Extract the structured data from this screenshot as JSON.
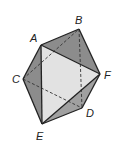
{
  "diagram": {
    "type": "octahedron",
    "vertices": {
      "A": {
        "label": "A",
        "x": 41,
        "y": 45,
        "lx": 30,
        "ly": 42
      },
      "B": {
        "label": "B",
        "x": 79,
        "y": 29,
        "lx": 75,
        "ly": 24
      },
      "C": {
        "label": "C",
        "x": 23,
        "y": 79,
        "lx": 12,
        "ly": 83
      },
      "D": {
        "label": "D",
        "x": 82,
        "y": 108,
        "lx": 86,
        "ly": 117
      },
      "E": {
        "label": "E",
        "x": 42,
        "y": 124,
        "lx": 36,
        "ly": 140
      },
      "F": {
        "label": "F",
        "x": 100,
        "y": 74,
        "lx": 104,
        "ly": 79
      }
    },
    "visible_edges": [
      "AB",
      "BF",
      "AF",
      "AC",
      "CE",
      "AE",
      "EF",
      "FD",
      "ED"
    ],
    "hidden_edges": [
      "CB",
      "CD",
      "BD"
    ],
    "colors": {
      "dark_face": "#8c8c8c",
      "mid_face": "#a9a9a9",
      "light_face": "#e2e2e2",
      "edge": "#222222"
    }
  }
}
